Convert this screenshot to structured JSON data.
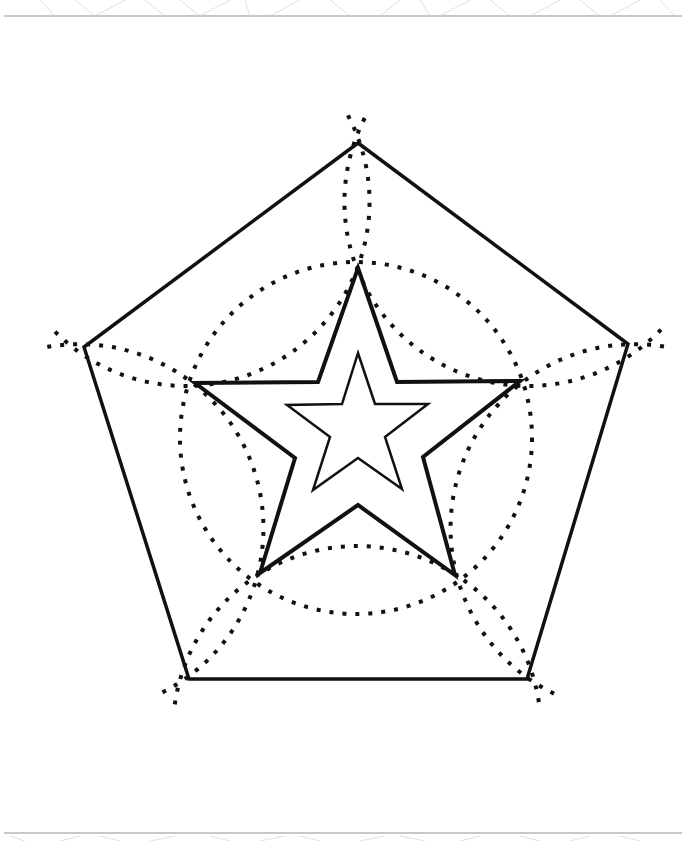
{
  "worksheet": {
    "title": "Pentagon and star tracing worksheet",
    "colors": {
      "ink": "#111111",
      "border": "#c8c8c8",
      "border_pattern": "#e0e0e0",
      "background": "#ffffff"
    },
    "top_border": {
      "y": 16,
      "x1": 4,
      "x2": 682
    },
    "bottom_border": {
      "y": 833,
      "x1": 4,
      "x2": 682
    },
    "border_pattern_top": [
      [
        40,
        0,
        55,
        16
      ],
      [
        75,
        0,
        95,
        16
      ],
      [
        95,
        16,
        125,
        0
      ],
      [
        145,
        0,
        165,
        16
      ],
      [
        180,
        0,
        200,
        16
      ],
      [
        200,
        16,
        230,
        0
      ],
      [
        245,
        0,
        250,
        16
      ],
      [
        270,
        16,
        300,
        0
      ],
      [
        330,
        0,
        350,
        16
      ],
      [
        380,
        16,
        400,
        0
      ],
      [
        420,
        0,
        430,
        16
      ],
      [
        440,
        16,
        470,
        0
      ],
      [
        490,
        0,
        510,
        16
      ],
      [
        530,
        16,
        560,
        0
      ],
      [
        580,
        0,
        600,
        16
      ],
      [
        610,
        16,
        640,
        0
      ],
      [
        660,
        0,
        675,
        16
      ]
    ],
    "border_pattern_bottom": [
      [
        10,
        836,
        25,
        841
      ],
      [
        60,
        841,
        80,
        836
      ],
      [
        100,
        836,
        120,
        841
      ],
      [
        150,
        841,
        175,
        836
      ],
      [
        210,
        836,
        230,
        841
      ],
      [
        260,
        841,
        285,
        836
      ],
      [
        300,
        836,
        320,
        841
      ],
      [
        360,
        841,
        385,
        836
      ],
      [
        400,
        836,
        425,
        841
      ],
      [
        460,
        841,
        480,
        836
      ],
      [
        520,
        836,
        540,
        841
      ],
      [
        570,
        841,
        590,
        836
      ],
      [
        620,
        836,
        640,
        841
      ]
    ],
    "pentagon": {
      "points": [
        [
          358,
          143
        ],
        [
          628,
          344
        ],
        [
          527,
          679
        ],
        [
          189,
          679
        ],
        [
          84,
          347
        ]
      ],
      "stroke_width": 3.5
    },
    "outer_star": {
      "points": [
        [
          358,
          268
        ],
        [
          397,
          382
        ],
        [
          520,
          381
        ],
        [
          423,
          457
        ],
        [
          455,
          575
        ],
        [
          358,
          505
        ],
        [
          260,
          573
        ],
        [
          295,
          458
        ],
        [
          195,
          383
        ],
        [
          318,
          382
        ]
      ],
      "stroke_width": 4
    },
    "inner_star": {
      "points": [
        [
          358,
          353
        ],
        [
          375,
          404
        ],
        [
          428,
          404
        ],
        [
          385,
          437
        ],
        [
          402,
          489
        ],
        [
          358,
          458
        ],
        [
          313,
          490
        ],
        [
          330,
          437
        ],
        [
          287,
          405
        ],
        [
          342,
          404
        ]
      ],
      "stroke_width": 2.5
    },
    "dotted_circle": {
      "cx": 356,
      "cy": 438,
      "r": 176
    },
    "dotted_arcs": [
      {
        "cx": 528.6,
        "cy": 201.8,
        "r": 184,
        "start": 44,
        "end": 208
      },
      {
        "cx": 634.7,
        "cy": 528.2,
        "r": 184,
        "start": 116,
        "end": 280
      },
      {
        "cx": 357,
        "cy": 730,
        "r": 184,
        "start": 188,
        "end": 352
      },
      {
        "cx": 79.3,
        "cy": 528.2,
        "r": 184,
        "start": 260,
        "end": 424
      },
      {
        "cx": 185.4,
        "cy": 201.8,
        "r": 184,
        "start": 332,
        "end": 496
      }
    ]
  }
}
